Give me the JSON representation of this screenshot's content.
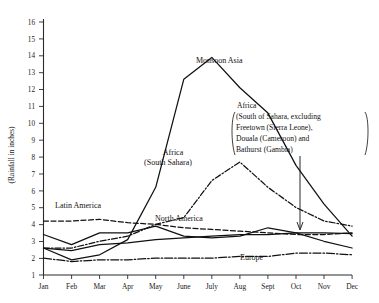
{
  "chart_data": {
    "type": "line",
    "title": "",
    "subtitle": "",
    "xlabel": "",
    "ylabel": "(Rainfall in inches)",
    "categories": [
      "Jan",
      "Feb",
      "Mar",
      "Apr",
      "May",
      "June",
      "July",
      "Aug",
      "Sept",
      "Oct",
      "Nov",
      "Dec"
    ],
    "ylim": [
      1,
      16
    ],
    "xlim_labels": [
      "Jan",
      "Dec"
    ],
    "ytick_labels": [
      "1",
      "2",
      "3",
      "4",
      "5",
      "6",
      "7",
      "8",
      "9",
      "10",
      "11",
      "12",
      "13",
      "14",
      "15",
      "16"
    ],
    "yticks": [
      1,
      2,
      3,
      4,
      5,
      6,
      7,
      8,
      9,
      10,
      11,
      12,
      13,
      14,
      15,
      16
    ],
    "grid": false,
    "legend_position": "inline-annotations",
    "series": [
      {
        "name": "Monsoon Asia",
        "label": "Monsoon Asia",
        "style": "solid",
        "values": [
          2.6,
          1.9,
          2.2,
          3.1,
          6.2,
          12.6,
          13.9,
          12.1,
          10.6,
          7.5,
          5.2,
          3.3
        ]
      },
      {
        "name": "Africa (South Sahara)",
        "label": "Africa\n(South Sahara)",
        "label_line1": "Africa",
        "label_line2": "(South Sahara)",
        "style": "dash-dot",
        "values": [
          2.6,
          2.6,
          3.0,
          3.3,
          4.0,
          4.4,
          6.6,
          7.7,
          6.2,
          5.0,
          4.2,
          3.9
        ]
      },
      {
        "name": "Latin America",
        "label": "Latin America",
        "style": "dashed",
        "values": [
          4.2,
          4.2,
          4.3,
          4.1,
          4.0,
          3.8,
          3.7,
          3.6,
          3.5,
          3.4,
          3.4,
          3.5
        ]
      },
      {
        "name": "North America",
        "label": "North America",
        "style": "solid-thin",
        "values": [
          3.4,
          2.8,
          3.5,
          3.5,
          3.9,
          3.3,
          3.2,
          3.3,
          3.8,
          3.5,
          3.0,
          2.6
        ]
      },
      {
        "name": "Europe",
        "label": "Europe",
        "style": "dash-dot-long",
        "values": [
          2.0,
          1.8,
          1.9,
          1.9,
          2.0,
          2.0,
          2.0,
          2.1,
          2.1,
          2.3,
          2.3,
          2.2
        ]
      },
      {
        "name": "Unlabeled lower series",
        "label": "",
        "style": "solid-thin2",
        "values": [
          2.6,
          2.45,
          2.8,
          2.9,
          3.1,
          3.2,
          3.3,
          3.4,
          3.4,
          3.5,
          3.5,
          3.45
        ]
      }
    ],
    "annotations": [
      {
        "name": "africa-note",
        "lines": [
          "Africa",
          "(South of Sahara, excluding",
          "Freetown (Sierra Leone),",
          "Douala (Cameroon) and",
          "Bathurst (Gambia)"
        ],
        "points_to": "Dec"
      }
    ]
  },
  "labels": {
    "monsoon_asia": "Monsoon Asia",
    "africa_line1": "Africa",
    "africa_line2": "(South Sahara)",
    "latin_america": "Latin America",
    "north_america": "North America",
    "europe": "Europe"
  },
  "note": {
    "l1": "Africa",
    "l2": "(South of Sahara, excluding",
    "l3": "Freetown (Sierra Leone),",
    "l4": "Douala (Cameroon) and",
    "l5": "Bathurst (Gambia)"
  },
  "axis": {
    "y_title": "(Rainfall in inches)",
    "y_ticks": [
      "16",
      "15",
      "14",
      "13",
      "12",
      "11",
      "10",
      "9",
      "8",
      "7",
      "6",
      "5",
      "4",
      "3",
      "2",
      "1"
    ],
    "x_ticks": [
      "Jan",
      "Feb",
      "Mar",
      "Apr",
      "May",
      "June",
      "July",
      "Aug",
      "Sept",
      "Oct",
      "Nov",
      "Dec"
    ]
  },
  "colors": {
    "ink": "#111111",
    "axis": "#2a2a2a",
    "background": "#ffffff"
  }
}
